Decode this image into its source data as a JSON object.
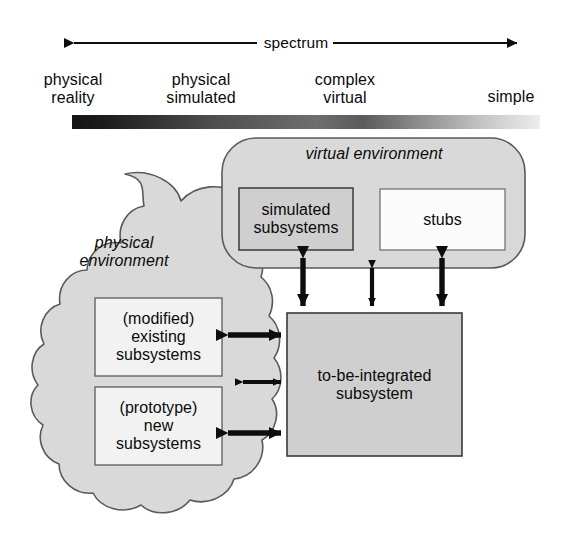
{
  "spectrum": {
    "axis_label": "spectrum",
    "arrow_icon": "double-headed-arrow-icon",
    "scale_labels": [
      {
        "id": "physical-reality",
        "text": "physical\nreality"
      },
      {
        "id": "physical-simulated",
        "text": "physical\nsimulated"
      },
      {
        "id": "complex-virtual",
        "text": "complex\nvirtual"
      },
      {
        "id": "simple",
        "text": "simple"
      }
    ],
    "gradient": {
      "from_color": "#1a1a1a",
      "to_color": "#ededed",
      "name": "spectrum-gradient-bar"
    }
  },
  "virtual_environment": {
    "title": "virtual environment",
    "fill_color": "#d9d9d9",
    "boxes": [
      {
        "id": "simulated-subsystems",
        "text": "simulated\nsubsystems",
        "fill_color": "#cfcfcf"
      },
      {
        "id": "stubs",
        "text": "stubs",
        "fill_color": "#fbfbfb"
      }
    ]
  },
  "physical_environment": {
    "title": "physical\nenvironment",
    "fill_color": "#d9d9d9",
    "boxes": [
      {
        "id": "modified-existing-subsystems",
        "text": "(modified)\nexisting\nsubsystems",
        "fill_color": "#f2f2f2"
      },
      {
        "id": "prototype-new-subsystems",
        "text": "(prototype)\nnew\nsubsystems",
        "fill_color": "#f2f2f2"
      }
    ]
  },
  "integration_target": {
    "id": "to-be-integrated-subsystem",
    "text": "to-be-integrated\nsubsystem",
    "fill_color": "#cfcfcf"
  },
  "connectors": [
    {
      "id": "connector-simulated-to-target",
      "orientation": "vertical",
      "style": "double-headed-arrow"
    },
    {
      "id": "connector-virtual-middle-to-target",
      "orientation": "vertical",
      "style": "double-headed-arrow"
    },
    {
      "id": "connector-stubs-to-target",
      "orientation": "vertical",
      "style": "double-headed-arrow"
    },
    {
      "id": "connector-existing-to-target",
      "orientation": "horizontal",
      "style": "double-headed-arrow"
    },
    {
      "id": "connector-physical-middle-to-target",
      "orientation": "horizontal",
      "style": "double-headed-arrow"
    },
    {
      "id": "connector-new-to-target",
      "orientation": "horizontal",
      "style": "double-headed-arrow"
    }
  ],
  "colors": {
    "stroke": "#555555",
    "dark_stroke": "#333333",
    "arrow": "#0d0d0d",
    "text": "#0a0a0a"
  }
}
